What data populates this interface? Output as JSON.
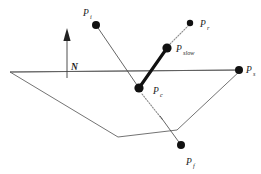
{
  "figure": {
    "background_color": "#ffffff",
    "line_color": "#4a4a4a",
    "highlight_color": "#111111",
    "dotted_color": "#8a8a8a",
    "width": 261,
    "height": 174
  },
  "labels": {
    "incident": {
      "base": "P",
      "sub": "i",
      "x": 83,
      "y": 16
    },
    "reflected": {
      "base": "P",
      "sub": "r",
      "x": 203,
      "y": 27
    },
    "slow": {
      "base": "P",
      "sub": "slow",
      "x": 177,
      "y": 52
    },
    "contact": {
      "base": "P",
      "sub": "c",
      "x": 155,
      "y": 95
    },
    "surface": {
      "base": "P",
      "sub": "s",
      "x": 247,
      "y": 73
    },
    "fast": {
      "base": "P",
      "sub": "f",
      "x": 196,
      "y": 166
    },
    "normal": {
      "base": "N",
      "sub": "",
      "x": 72,
      "y": 70
    }
  },
  "nodes": [
    {
      "name": "point-pi",
      "label": "P_i",
      "x": 96,
      "y": 25,
      "r": 4.0
    },
    {
      "name": "point-pr",
      "label": "P_r",
      "x": 190,
      "y": 23,
      "r": 3.2
    },
    {
      "name": "point-pslow",
      "label": "P_slow",
      "x": 167,
      "y": 48,
      "r": 4.6
    },
    {
      "name": "point-pc",
      "label": "P_c",
      "x": 139,
      "y": 88,
      "r": 4.6
    },
    {
      "name": "point-ps",
      "label": "P_s",
      "x": 239,
      "y": 70,
      "r": 4.0
    },
    {
      "name": "point-pf",
      "label": "P_f",
      "x": 181,
      "y": 145,
      "r": 4.0
    }
  ],
  "edges": [
    {
      "name": "incident-ray",
      "style": "thin",
      "from": "P_i",
      "to": "P_c",
      "x1": 96,
      "y1": 25,
      "x2": 139,
      "y2": 88
    },
    {
      "name": "slow-ray",
      "style": "thick",
      "from": "P_c",
      "to": "P_slow",
      "x1": 139,
      "y1": 88,
      "x2": 167,
      "y2": 48
    },
    {
      "name": "reflected-ray",
      "style": "dotted",
      "from": "P_slow",
      "to": "P_r",
      "x1": 170,
      "y1": 44,
      "x2": 189,
      "y2": 26
    },
    {
      "name": "refracted-ray-dotted",
      "style": "dotted",
      "from": "P_c",
      "to": "crossing",
      "x1": 142,
      "y1": 93,
      "x2": 163,
      "y2": 120
    },
    {
      "name": "refracted-ray-solid",
      "style": "thin",
      "from": "crossing",
      "to": "P_f",
      "x1": 160,
      "y1": 116,
      "x2": 181,
      "y2": 145
    }
  ],
  "plane": {
    "name": "surface-plane",
    "horizon_y": 72,
    "points": "10,72 241,70 177,130 118,137"
  },
  "normal_arrow": {
    "name": "normal-arrow",
    "x": 67,
    "y_top": 33,
    "y_bottom": 78,
    "head_width": 5.5,
    "head_height": 11
  }
}
